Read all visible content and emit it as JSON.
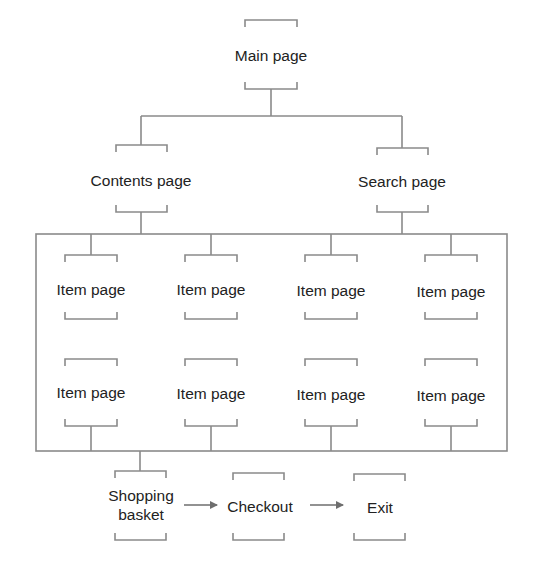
{
  "diagram": {
    "type": "site-map",
    "line_color": "#808080",
    "text_color": "#222222",
    "nodes": {
      "main": {
        "label": "Main page"
      },
      "contents": {
        "label": "Contents page"
      },
      "search": {
        "label": "Search page"
      },
      "items": [
        {
          "label": "Item page"
        },
        {
          "label": "Item page"
        },
        {
          "label": "Item page"
        },
        {
          "label": "Item page"
        },
        {
          "label": "Item page"
        },
        {
          "label": "Item page"
        },
        {
          "label": "Item page"
        },
        {
          "label": "Item page"
        }
      ],
      "basket": {
        "label_line1": "Shopping",
        "label_line2": "basket"
      },
      "checkout": {
        "label": "Checkout"
      },
      "exit": {
        "label": "Exit"
      }
    },
    "edges": [
      {
        "from": "Main page",
        "to": "Contents page"
      },
      {
        "from": "Main page",
        "to": "Search page"
      },
      {
        "from": "Contents page",
        "to": "Item pages group"
      },
      {
        "from": "Search page",
        "to": "Item pages group"
      },
      {
        "from": "Item pages group",
        "to": "Shopping basket"
      },
      {
        "from": "Shopping basket",
        "to": "Checkout",
        "arrow": true
      },
      {
        "from": "Checkout",
        "to": "Exit",
        "arrow": true
      }
    ]
  }
}
